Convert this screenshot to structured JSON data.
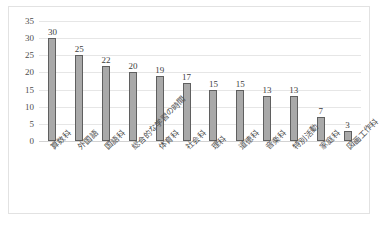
{
  "chart_data": {
    "type": "bar",
    "title": "",
    "xlabel": "",
    "ylabel": "",
    "ylim": [
      0,
      35
    ],
    "ytick_step": 5,
    "yticks": [
      0,
      5,
      10,
      15,
      20,
      25,
      30,
      35
    ],
    "grid": true,
    "legend": false,
    "categories": [
      "算数科",
      "外国語",
      "国語科",
      "総合的な学習の時間",
      "体育科",
      "社会科",
      "理科",
      "道徳科",
      "音楽科",
      "特別活動",
      "家庭科",
      "図画工作科"
    ],
    "values": [
      30,
      25,
      22,
      20,
      19,
      17,
      15,
      15,
      13,
      13,
      7,
      3
    ],
    "data_labels": [
      "30",
      "25",
      "22",
      "20",
      "19",
      "17",
      "15",
      "15",
      "13",
      "13",
      "7",
      "3"
    ],
    "bar_fill_color": "#a9a9a9",
    "bar_border_color": "#5f5f5f",
    "gridline_color": "#e6e6e6",
    "axis_text_color": "#4d4d4d",
    "plot_background": "#ffffff",
    "frame_border_color": "#e2e2e2"
  }
}
